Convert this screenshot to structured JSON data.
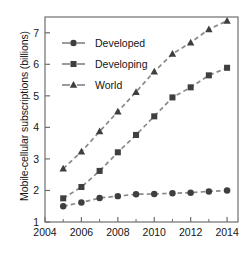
{
  "chart_data": {
    "type": "line",
    "title": "",
    "xlabel": "",
    "ylabel": "Mobile-cellular subscriptions (billions)",
    "x": [
      2005,
      2006,
      2007,
      2008,
      2009,
      2010,
      2011,
      2012,
      2013,
      2014
    ],
    "xlim": [
      2004,
      2014.6
    ],
    "ylim": [
      1,
      7.5
    ],
    "xticks": [
      2004,
      2006,
      2008,
      2010,
      2012,
      2014
    ],
    "xticklabels": [
      "2004",
      "2006",
      "2008",
      "2010",
      "2012",
      "2014"
    ],
    "xminorticks": [
      2005,
      2007,
      2009,
      2011,
      2013
    ],
    "yticks": [
      1,
      2,
      3,
      4,
      5,
      6,
      7
    ],
    "yticklabels": [
      "1",
      "2",
      "3",
      "4",
      "5",
      "6",
      "7"
    ],
    "grid": false,
    "legend_position": "upper left",
    "line_style": "dashed",
    "line_color": "#8a8a8a",
    "marker_color": "#3f3f3f",
    "axis_color": "#6e6e6e",
    "text_color": "#151515",
    "series": [
      {
        "name": "Developed",
        "marker": "circle",
        "values": [
          1.5,
          1.62,
          1.76,
          1.82,
          1.88,
          1.89,
          1.91,
          1.93,
          1.97,
          2.0
        ]
      },
      {
        "name": "Developing",
        "marker": "square",
        "values": [
          1.75,
          2.11,
          2.62,
          3.21,
          3.76,
          4.35,
          4.95,
          5.27,
          5.65,
          5.89
        ]
      },
      {
        "name": "World",
        "marker": "triangle",
        "values": [
          2.69,
          3.23,
          3.87,
          4.5,
          5.12,
          5.77,
          6.33,
          6.69,
          7.11,
          7.38
        ]
      }
    ]
  },
  "legend": {
    "items": [
      {
        "label": "Developed"
      },
      {
        "label": "Developing"
      },
      {
        "label": "World"
      }
    ]
  }
}
